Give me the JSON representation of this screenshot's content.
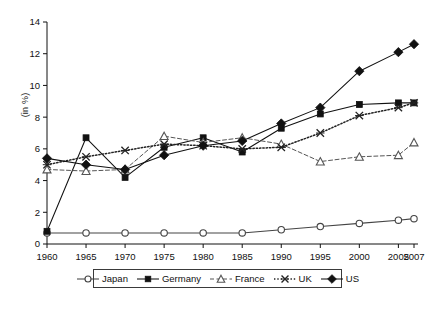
{
  "figure": {
    "caption": "",
    "y_axis_label": "(in %)"
  },
  "legend": {
    "entries": [
      {
        "label": "Japan",
        "marker": "open-circle",
        "line": "solid",
        "color": "#444444"
      },
      {
        "label": "Germany",
        "marker": "filled-square",
        "line": "solid",
        "color": "#111111"
      },
      {
        "label": "France",
        "marker": "open-triangle",
        "line": "dashed",
        "color": "#555555"
      },
      {
        "label": "UK",
        "marker": "cross-x",
        "line": "dotted",
        "color": "#222222"
      },
      {
        "label": "US",
        "marker": "filled-diamond",
        "line": "solid",
        "color": "#111111"
      }
    ]
  },
  "chart_data": {
    "type": "line",
    "title": "",
    "subtitle": "",
    "xlabel": "",
    "ylabel": "(in %)",
    "grid": false,
    "legend_position": "bottom",
    "categories": [
      "1960",
      "1965",
      "1970",
      "1975",
      "1980",
      "1985",
      "1990",
      "1995",
      "2000",
      "2005",
      "2007"
    ],
    "x_tick_labels": [
      "1960",
      "1965",
      "1970",
      "1975",
      "1980",
      "1985",
      "1990",
      "1995",
      "2000",
      "2005",
      "2007"
    ],
    "y_tick_labels": [
      "0",
      "2",
      "4",
      "6",
      "8",
      "10",
      "12",
      "14"
    ],
    "ylim": [
      0,
      14
    ],
    "ytick_step": 2,
    "series": [
      {
        "name": "Japan",
        "marker": "open-circle",
        "line": "solid",
        "color": "#444444",
        "values": [
          0.7,
          0.7,
          0.7,
          0.7,
          0.7,
          0.7,
          0.9,
          1.1,
          1.3,
          1.5,
          1.6
        ]
      },
      {
        "name": "Germany",
        "marker": "filled-square",
        "line": "solid",
        "color": "#111111",
        "values": [
          0.8,
          6.7,
          4.2,
          6.1,
          6.7,
          5.8,
          7.3,
          8.2,
          8.8,
          8.9,
          8.9
        ]
      },
      {
        "name": "France",
        "marker": "open-triangle",
        "line": "dashed",
        "color": "#555555",
        "values": [
          4.7,
          4.6,
          4.7,
          6.8,
          6.4,
          6.7,
          6.3,
          5.2,
          5.5,
          5.6,
          6.4
        ]
      },
      {
        "name": "UK",
        "marker": "cross-x",
        "line": "dotted",
        "color": "#222222",
        "values": [
          5.0,
          5.5,
          5.9,
          6.3,
          6.2,
          6.0,
          6.1,
          7.0,
          8.1,
          8.6,
          8.9
        ]
      },
      {
        "name": "US",
        "marker": "filled-diamond",
        "line": "solid",
        "color": "#111111",
        "values": [
          5.4,
          5.0,
          4.7,
          5.6,
          6.2,
          6.5,
          7.6,
          8.6,
          10.9,
          12.1,
          12.6
        ]
      }
    ]
  }
}
